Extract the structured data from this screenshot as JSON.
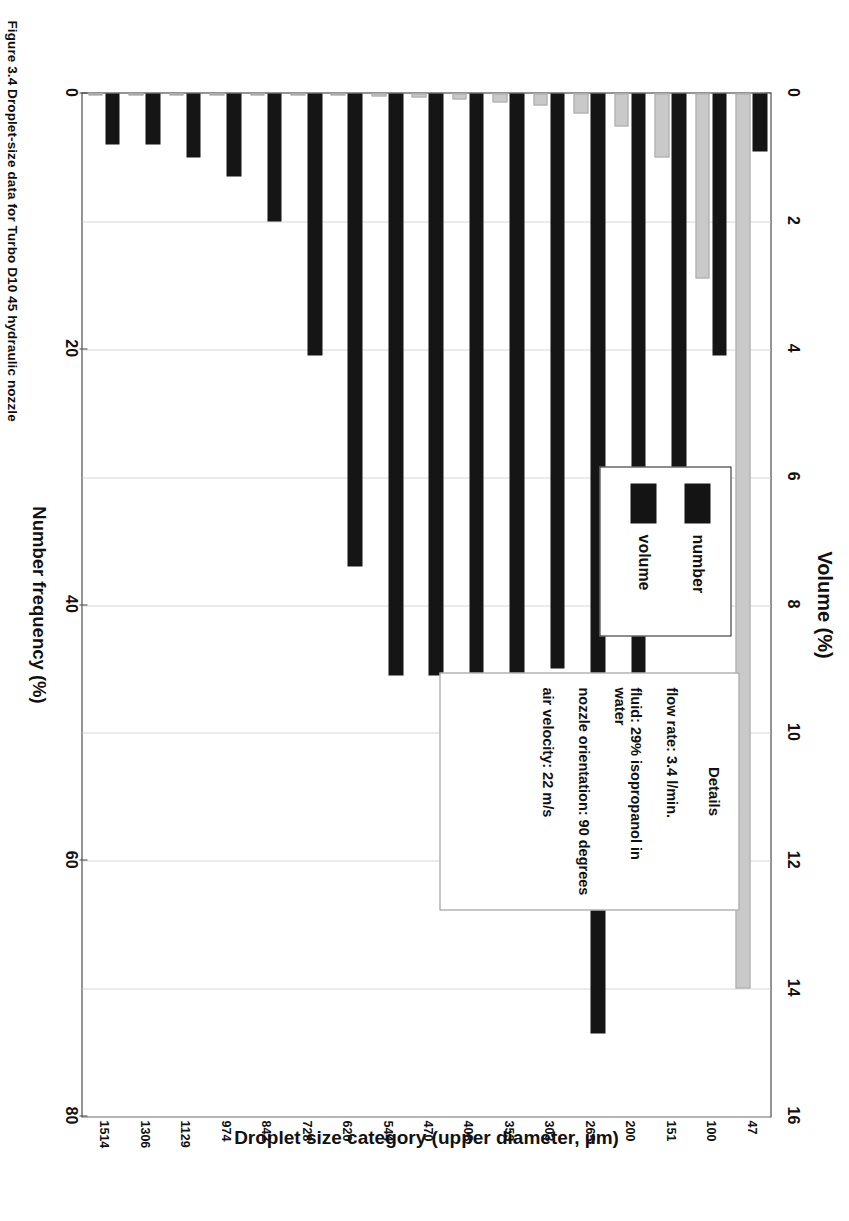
{
  "figure": {
    "caption": "Figure 3.4   Droplet-size data for Turbo D10 45 hydraulic nozzle"
  },
  "axes": {
    "top": {
      "title": "Volume (%)",
      "ticks": [
        0,
        2,
        4,
        6,
        8,
        10,
        12,
        14,
        16
      ],
      "min": 0,
      "max": 16
    },
    "bottom": {
      "title": "Number frequency (%)",
      "ticks": [
        0,
        20,
        40,
        60,
        80
      ],
      "min": 0,
      "max": 80
    },
    "category": {
      "title": "Droplet size category (upper diameter, µm)"
    }
  },
  "legend": {
    "entries": [
      {
        "label": "number",
        "color": "#141414"
      },
      {
        "label": "volume",
        "color": "#141414"
      }
    ]
  },
  "details": {
    "heading": "Details",
    "lines": [
      "flow rate: 3.4 l/min.",
      "fluid: 29% isopropanol in water",
      "nozzle orientation: 90 degrees",
      "air velocity: 22 m/s"
    ]
  },
  "chart_data": {
    "type": "bar",
    "orientation": "horizontal",
    "xlabel": "Number frequency (%) / Volume (%)",
    "ylabel": "Droplet size category (upper diameter, µm)",
    "categories": [
      "47",
      "100",
      "151",
      "200",
      "265",
      "303",
      "353",
      "408",
      "470",
      "544",
      "620",
      "728",
      "842",
      "974",
      "1129",
      "1306",
      "1514"
    ],
    "series": [
      {
        "name": "number",
        "axis": "bottom",
        "unit": "%",
        "color": "#c9c9c9",
        "values": [
          70.0,
          14.5,
          5.0,
          2.6,
          1.6,
          0.9,
          0.7,
          0.5,
          0.3,
          0.2,
          0.15,
          0.1,
          0.08,
          0.05,
          0.04,
          0.03,
          0.02
        ]
      },
      {
        "name": "volume",
        "axis": "top",
        "unit": "%",
        "color": "#151515",
        "values": [
          0.9,
          4.1,
          7.1,
          9.4,
          14.7,
          9.0,
          9.6,
          9.8,
          9.1,
          9.1,
          7.4,
          4.1,
          2.0,
          1.3,
          1.0,
          0.8,
          0.8
        ]
      }
    ],
    "grid": true,
    "legend_position": "inside-upper-right"
  }
}
